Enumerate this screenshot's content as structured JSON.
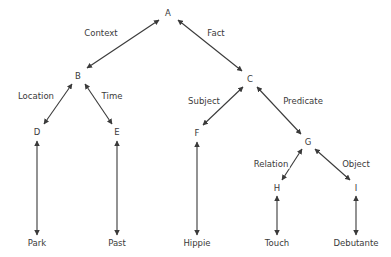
{
  "diagram": {
    "type": "tree-diagram",
    "colors": {
      "background": "#ffffff",
      "text": "#3a3a3a",
      "stroke": "#3a3a3a"
    },
    "nodes": [
      {
        "id": "A",
        "label": "A",
        "x": 168,
        "y": 13
      },
      {
        "id": "B",
        "label": "B",
        "x": 78,
        "y": 76
      },
      {
        "id": "C",
        "label": "C",
        "x": 250,
        "y": 79
      },
      {
        "id": "D",
        "label": "D",
        "x": 37,
        "y": 132
      },
      {
        "id": "E",
        "label": "E",
        "x": 117,
        "y": 132
      },
      {
        "id": "F",
        "label": "F",
        "x": 197,
        "y": 133
      },
      {
        "id": "G",
        "label": "G",
        "x": 308,
        "y": 142
      },
      {
        "id": "H",
        "label": "H",
        "x": 277,
        "y": 188
      },
      {
        "id": "I",
        "label": "I",
        "x": 356,
        "y": 188
      }
    ],
    "leaves": [
      {
        "id": "park",
        "label": "Park",
        "x": 37,
        "y": 243
      },
      {
        "id": "past",
        "label": "Past",
        "x": 117,
        "y": 243
      },
      {
        "id": "hippie",
        "label": "Hippie",
        "x": 197,
        "y": 243
      },
      {
        "id": "touch",
        "label": "Touch",
        "x": 277,
        "y": 243
      },
      {
        "id": "debutante",
        "label": "Debutante",
        "x": 356,
        "y": 243
      }
    ],
    "edge_labels": [
      {
        "id": "context",
        "label": "Context",
        "x": 101,
        "y": 33
      },
      {
        "id": "fact",
        "label": "Fact",
        "x": 216,
        "y": 33
      },
      {
        "id": "location",
        "label": "Location",
        "x": 36,
        "y": 96
      },
      {
        "id": "time",
        "label": "Time",
        "x": 112,
        "y": 96
      },
      {
        "id": "subject",
        "label": "Subject",
        "x": 204,
        "y": 101
      },
      {
        "id": "predicate",
        "label": "Predicate",
        "x": 303,
        "y": 101
      },
      {
        "id": "relation",
        "label": "Relation",
        "x": 271,
        "y": 164
      },
      {
        "id": "object",
        "label": "Object",
        "x": 356,
        "y": 164
      }
    ],
    "edges": [
      {
        "id": "edge-a-b",
        "from": "A",
        "to": "B",
        "label": "Context",
        "x1": 159,
        "y1": 20,
        "x2": 87,
        "y2": 68,
        "double": true
      },
      {
        "id": "edge-a-c",
        "from": "A",
        "to": "C",
        "label": "Fact",
        "x1": 178,
        "y1": 20,
        "x2": 242,
        "y2": 71,
        "double": true
      },
      {
        "id": "edge-b-d",
        "from": "B",
        "to": "D",
        "label": "Location",
        "x1": 72,
        "y1": 84,
        "x2": 44,
        "y2": 124,
        "double": true
      },
      {
        "id": "edge-b-e",
        "from": "B",
        "to": "E",
        "label": "Time",
        "x1": 85,
        "y1": 84,
        "x2": 112,
        "y2": 124,
        "double": true
      },
      {
        "id": "edge-c-f",
        "from": "C",
        "to": "F",
        "label": "Subject",
        "x1": 243,
        "y1": 87,
        "x2": 203,
        "y2": 125,
        "double": true
      },
      {
        "id": "edge-c-g",
        "from": "C",
        "to": "G",
        "label": "Predicate",
        "x1": 257,
        "y1": 87,
        "x2": 301,
        "y2": 134,
        "double": true
      },
      {
        "id": "edge-g-h",
        "from": "G",
        "to": "H",
        "label": "Relation",
        "x1": 302,
        "y1": 149,
        "x2": 282,
        "y2": 180,
        "double": true
      },
      {
        "id": "edge-g-i",
        "from": "G",
        "to": "I",
        "label": "Object",
        "x1": 315,
        "y1": 149,
        "x2": 350,
        "y2": 180,
        "double": true
      },
      {
        "id": "edge-d-park",
        "from": "D",
        "to": "Park",
        "label": "",
        "x1": 37,
        "y1": 141,
        "x2": 37,
        "y2": 235,
        "double": true
      },
      {
        "id": "edge-e-past",
        "from": "E",
        "to": "Past",
        "label": "",
        "x1": 117,
        "y1": 141,
        "x2": 117,
        "y2": 235,
        "double": true
      },
      {
        "id": "edge-f-hippie",
        "from": "F",
        "to": "Hippie",
        "label": "",
        "x1": 197,
        "y1": 142,
        "x2": 197,
        "y2": 235,
        "double": true
      },
      {
        "id": "edge-h-touch",
        "from": "H",
        "to": "Touch",
        "label": "",
        "x1": 277,
        "y1": 196,
        "x2": 277,
        "y2": 235,
        "double": true
      },
      {
        "id": "edge-i-debutante",
        "from": "I",
        "to": "Debutante",
        "label": "",
        "x1": 356,
        "y1": 196,
        "x2": 356,
        "y2": 235,
        "double": true
      }
    ]
  }
}
